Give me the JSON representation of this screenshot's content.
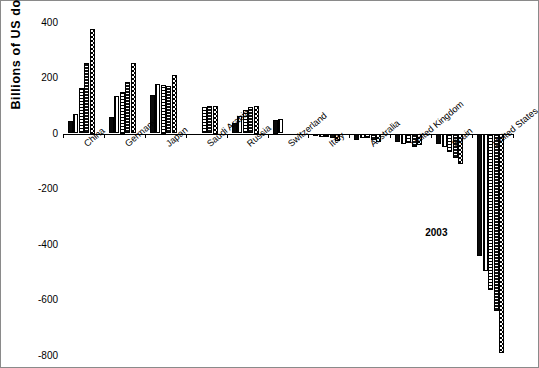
{
  "chart_data": {
    "type": "bar",
    "title": "",
    "subtitle": "",
    "xlabel": "",
    "ylabel": "Billions of US dollars  .",
    "ylim": [
      -800,
      400
    ],
    "yticks": [
      400,
      200,
      0,
      -200,
      -400,
      -600,
      -800
    ],
    "ytick_labels": [
      "400",
      "200",
      "0",
      "-200",
      "-400",
      "-600",
      "-800"
    ],
    "grid": false,
    "legend": "none",
    "annotations": [
      {
        "text": "2003",
        "x_frac": 0.805,
        "y_value": -360
      }
    ],
    "categories": [
      "China",
      "Germany",
      "Japan",
      "Saudi Arabia",
      "Russia",
      "Switzerland",
      "Italy",
      "Australia",
      "United Kingdom",
      "Spain",
      "United States"
    ],
    "series": [
      {
        "name": "1999",
        "pattern": "solid-black",
        "values": [
          46,
          58,
          140,
          0,
          38,
          50,
          -9,
          -22,
          -32,
          -38,
          -440
        ]
      },
      {
        "name": "2000",
        "pattern": "vertical-stripes",
        "values": [
          69,
          135,
          178,
          0,
          64,
          52,
          -13,
          -15,
          -38,
          -50,
          -495
        ]
      },
      {
        "name": "2001",
        "pattern": "horizontal-stripes",
        "values": [
          165,
          150,
          175,
          95,
          84,
          0,
          -14,
          -17,
          -34,
          -65,
          -565
        ]
      },
      {
        "name": "2002",
        "pattern": "dense-dots",
        "values": [
          255,
          185,
          172,
          98,
          97,
          0,
          -18,
          -22,
          -48,
          -90,
          -640
        ]
      },
      {
        "name": "2003",
        "pattern": "checkerboard",
        "values": [
          375,
          255,
          212,
          100,
          100,
          0,
          -27,
          -31,
          -42,
          -110,
          -790
        ]
      }
    ]
  },
  "axis": {
    "y_title": "Billions of US dollars  ."
  }
}
